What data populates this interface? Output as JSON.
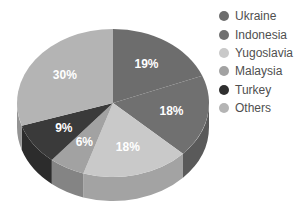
{
  "chart_data": {
    "type": "pie",
    "title": "",
    "subtitle": "",
    "xlabel": "",
    "ylabel": "",
    "three_d": true,
    "start_angle_deg": 0,
    "direction": "clockwise",
    "legend_position": "right",
    "grid": false,
    "categories": [
      "Ukraine",
      "Indonesia",
      "Yugoslavia",
      "Malaysia",
      "Turkey",
      "Others"
    ],
    "values": [
      19,
      18,
      18,
      6,
      9,
      30
    ],
    "value_unit": "%",
    "data_labels": [
      "19%",
      "18%",
      "18%",
      "6%",
      "9%",
      "30%"
    ],
    "slices": [
      {
        "label": "Ukraine",
        "value": 19,
        "data_label": "19%",
        "color": "#6d6d6d",
        "side_color": "#565656"
      },
      {
        "label": "Indonesia",
        "value": 18,
        "data_label": "18%",
        "color": "#707070",
        "side_color": "#5a5a5a"
      },
      {
        "label": "Yugoslavia",
        "value": 18,
        "data_label": "18%",
        "color": "#c9c9c9",
        "side_color": "#a3a3a3"
      },
      {
        "label": "Malaysia",
        "value": 6,
        "data_label": "6%",
        "color": "#a2a2a2",
        "side_color": "#848484"
      },
      {
        "label": "Turkey",
        "value": 9,
        "data_label": "9%",
        "color": "#3a3a3a",
        "side_color": "#2c2c2c"
      },
      {
        "label": "Others",
        "value": 30,
        "data_label": "30%",
        "color": "#b4b4b4",
        "side_color": "#949494"
      }
    ]
  },
  "legend": {
    "items": [
      {
        "label": "Ukraine",
        "color": "#6d6d6d"
      },
      {
        "label": "Indonesia",
        "color": "#707070"
      },
      {
        "label": "Yugoslavia",
        "color": "#c9c9c9"
      },
      {
        "label": "Malaysia",
        "color": "#a2a2a2"
      },
      {
        "label": "Turkey",
        "color": "#2f2f2f"
      },
      {
        "label": "Others",
        "color": "#b4b4b4"
      }
    ]
  },
  "colors": {
    "background": "#ffffff",
    "legend_text": "#4f4f4f",
    "data_label_text": "#ffffff"
  }
}
